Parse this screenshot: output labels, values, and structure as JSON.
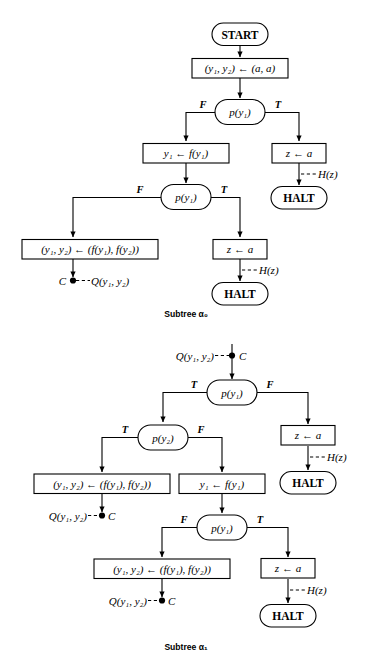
{
  "figure": {
    "type": "flowchart-diagram",
    "background": "#ffffff",
    "ink_color": "#000000"
  },
  "labels": {
    "start": "START",
    "halt": "HALT",
    "init_assign": "(y₁, y₂) ← (a, a)",
    "pred_y1": "p(y₁)",
    "pred_y2": "p(y₂)",
    "assign_y1": "y₁ ← f(y₁)",
    "assign_pair": "(y₁, y₂) ← (f(y₁), f(y₂))",
    "assign_z": "z ← a",
    "out_H": "H(z)",
    "out_Q": "Q(y₁, y₂)",
    "conn_C": "C",
    "branch_true": "T",
    "branch_false": "F",
    "caption_alpha0": "Subtree α₀",
    "caption_alpha1": "Subtree α₁"
  },
  "subtree_alpha0": {
    "caption": "Subtree α₀",
    "nodes": [
      {
        "id": "a0-start",
        "kind": "terminal",
        "text": "START"
      },
      {
        "id": "a0-init",
        "kind": "process",
        "text": "(y₁, y₂) ← (a, a)"
      },
      {
        "id": "a0-pred1",
        "kind": "decision",
        "text": "p(y₁)"
      },
      {
        "id": "a0-assign-y1",
        "kind": "process",
        "text": "y₁ ← f(y₁)"
      },
      {
        "id": "a0-assign-z1",
        "kind": "process",
        "text": "z ← a"
      },
      {
        "id": "a0-halt1",
        "kind": "terminal",
        "text": "HALT"
      },
      {
        "id": "a0-pred2",
        "kind": "decision",
        "text": "p(y₁)"
      },
      {
        "id": "a0-assign-pair",
        "kind": "process",
        "text": "(y₁, y₂) ← (f(y₁), f(y₂))"
      },
      {
        "id": "a0-assign-z2",
        "kind": "process",
        "text": "z ← a"
      },
      {
        "id": "a0-halt2",
        "kind": "terminal",
        "text": "HALT"
      },
      {
        "id": "a0-conn-c",
        "kind": "connector",
        "text": "C"
      }
    ],
    "output_labels": [
      {
        "id": "a0-out-h1",
        "text": "H(z)"
      },
      {
        "id": "a0-out-h2",
        "text": "H(z)"
      },
      {
        "id": "a0-out-q",
        "text": "Q(y₁, y₂)"
      }
    ],
    "branch_labels": [
      {
        "from": "a0-pred1",
        "side": "left",
        "text": "F"
      },
      {
        "from": "a0-pred1",
        "side": "right",
        "text": "T"
      },
      {
        "from": "a0-pred2",
        "side": "left",
        "text": "F"
      },
      {
        "from": "a0-pred2",
        "side": "right",
        "text": "T"
      }
    ]
  },
  "subtree_alpha1": {
    "caption": "Subtree α₁",
    "nodes": [
      {
        "id": "a1-conn-in",
        "kind": "connector",
        "text": "C"
      },
      {
        "id": "a1-pred1",
        "kind": "decision",
        "text": "p(y₁)"
      },
      {
        "id": "a1-pred2",
        "kind": "decision",
        "text": "p(y₂)"
      },
      {
        "id": "a1-assign-z1",
        "kind": "process",
        "text": "z ← a"
      },
      {
        "id": "a1-halt1",
        "kind": "terminal",
        "text": "HALT"
      },
      {
        "id": "a1-assign-pair1",
        "kind": "process",
        "text": "(y₁, y₂) ← (f(y₁), f(y₂))"
      },
      {
        "id": "a1-assign-y1",
        "kind": "process",
        "text": "y₁ ← f(y₁)"
      },
      {
        "id": "a1-conn-c1",
        "kind": "connector",
        "text": "C"
      },
      {
        "id": "a1-pred3",
        "kind": "decision",
        "text": "p(y₁)"
      },
      {
        "id": "a1-assign-pair2",
        "kind": "process",
        "text": "(y₁, y₂) ← (f(y₁), f(y₂))"
      },
      {
        "id": "a1-assign-z2",
        "kind": "process",
        "text": "z ← a"
      },
      {
        "id": "a1-halt2",
        "kind": "terminal",
        "text": "HALT"
      },
      {
        "id": "a1-conn-c2",
        "kind": "connector",
        "text": "C"
      }
    ],
    "output_labels": [
      {
        "id": "a1-in-q",
        "text": "Q(y₁, y₂)"
      },
      {
        "id": "a1-out-h1",
        "text": "H(z)"
      },
      {
        "id": "a1-out-q1",
        "text": "Q(y₁, y₂)"
      },
      {
        "id": "a1-out-q2",
        "text": "Q(y₁, y₂)"
      },
      {
        "id": "a1-out-h2",
        "text": "H(z)"
      }
    ],
    "branch_labels": [
      {
        "from": "a1-pred1",
        "side": "left",
        "text": "T"
      },
      {
        "from": "a1-pred1",
        "side": "right",
        "text": "F"
      },
      {
        "from": "a1-pred2",
        "side": "left",
        "text": "T"
      },
      {
        "from": "a1-pred2",
        "side": "right",
        "text": "F"
      },
      {
        "from": "a1-pred3",
        "side": "left",
        "text": "F"
      },
      {
        "from": "a1-pred3",
        "side": "right",
        "text": "T"
      }
    ]
  }
}
